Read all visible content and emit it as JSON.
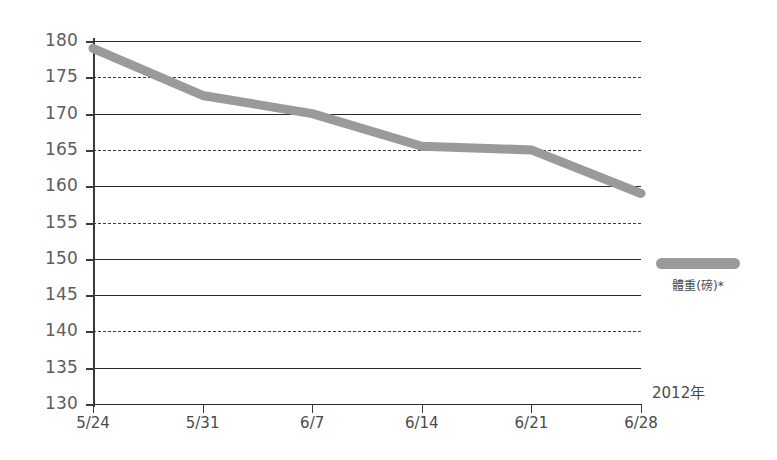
{
  "chart_data": {
    "type": "line",
    "title": "",
    "subtitle": "",
    "xlabel": "",
    "ylabel": "",
    "categories": [
      "5/24",
      "5/31",
      "6/7",
      "6/14",
      "6/21",
      "6/28"
    ],
    "series": [
      {
        "name": "體重(磅)*",
        "color": "#9a9a9a",
        "values": [
          179,
          172.5,
          170,
          165.5,
          165,
          159
        ]
      }
    ],
    "ylim": [
      130,
      180
    ],
    "ytick_step": 5,
    "ytick_labels": [
      "180",
      "175",
      "170",
      "165",
      "160",
      "155",
      "150",
      "145",
      "140",
      "135",
      "130"
    ],
    "grid": true,
    "grid_axis": "y",
    "legend_position": "right",
    "annotations": [
      {
        "text": "2012年",
        "position": "bottom-right"
      }
    ]
  },
  "legend": {
    "entries": [
      {
        "label": "體重(磅)*",
        "swatch_color": "#9a9a9a"
      }
    ]
  },
  "axes": {
    "y": {
      "ticks": [
        "180",
        "175",
        "170",
        "165",
        "160",
        "155",
        "150",
        "145",
        "140",
        "135",
        "130"
      ]
    },
    "x": {
      "ticks": [
        "5/24",
        "5/31",
        "6/7",
        "6/14",
        "6/21",
        "6/28"
      ]
    }
  },
  "annotations": {
    "year": "2012年"
  },
  "colors": {
    "series": "#9a9a9a",
    "grid": "#2b2b2b",
    "axis": "#3a3a3a",
    "tick_text": "#5d5d5d",
    "background": "#ffffff"
  }
}
